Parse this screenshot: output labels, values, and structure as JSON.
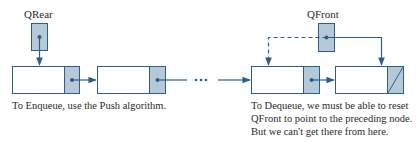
{
  "diagram": {
    "pointers": {
      "rear": {
        "label": "QRear"
      },
      "front": {
        "label": "QFront"
      }
    },
    "nodes": [
      {
        "id": "node-1",
        "next": "node-2",
        "null_link": false
      },
      {
        "id": "node-2",
        "next": "ellipsis",
        "null_link": false
      },
      {
        "id": "node-3",
        "next": "node-4",
        "null_link": false
      },
      {
        "id": "node-4",
        "next": null,
        "null_link": true
      }
    ],
    "ellipsis": "• • •",
    "captions": {
      "enqueue": "To Enqueue, use the Push algorithm.",
      "dequeue_lines": [
        "To Dequeue, we must be able to reset",
        "QFront to point to the preceding node.",
        "But we can't get there from here."
      ]
    },
    "colors": {
      "stroke": "#2b5f8a",
      "pointer_fill": "#b7c9d9",
      "node_fill": "#ffffff",
      "text": "#2a2a2a"
    }
  }
}
